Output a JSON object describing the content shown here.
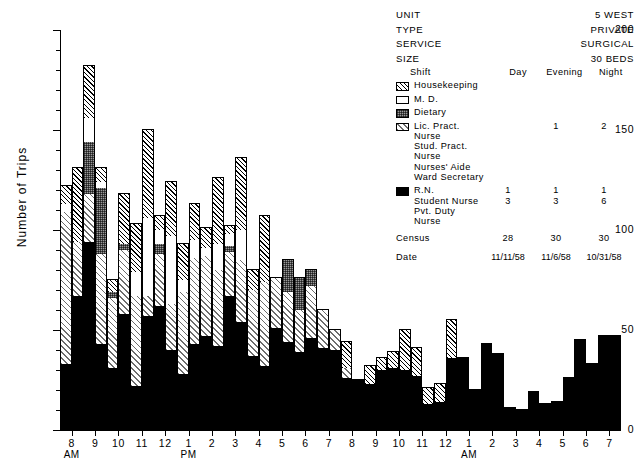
{
  "header": {
    "rows": [
      {
        "key": "UNIT",
        "value": "5 WEST"
      },
      {
        "key": "TYPE",
        "value": "PRIVATE"
      },
      {
        "key": "SERVICE",
        "value": "SURGICAL"
      },
      {
        "key": "SIZE",
        "value": "30 BEDS"
      }
    ]
  },
  "legend": {
    "shift_label": "Shift",
    "columns": [
      "Day",
      "Evening",
      "Night"
    ],
    "groups": [
      {
        "swatch": "hatch-swatch",
        "fill": "f-house",
        "names": [
          "Housekeeping"
        ],
        "counts": [
          "",
          "",
          ""
        ]
      },
      {
        "swatch": "white-swatch",
        "fill": "f-md",
        "names": [
          "M. D."
        ],
        "counts": [
          "",
          "",
          ""
        ]
      },
      {
        "swatch": "stipple-swatch",
        "fill": "f-diet",
        "names": [
          "Dietary"
        ],
        "counts": [
          "",
          "",
          ""
        ]
      },
      {
        "swatch": "light-hatch-swatch",
        "fill": "f-lpn",
        "names": [
          "Lic. Pract. Nurse",
          "Stud. Pract. Nurse",
          "Nurses' Aide",
          "Ward Secretary"
        ],
        "counts": [
          "",
          "1",
          "2",
          ""
        ]
      },
      {
        "swatch": "solid-swatch",
        "fill": "f-rn",
        "names": [
          "R.N.",
          "Student Nurse",
          "Pvt. Duty Nurse"
        ],
        "counts": [
          "1",
          "1",
          "1",
          "3",
          "3",
          "6"
        ]
      }
    ],
    "census_label": "Census",
    "census": [
      "28",
      "30",
      "30"
    ],
    "date_label": "Date",
    "dates": [
      "11/11/58",
      "11/6/58",
      "10/31/58"
    ]
  },
  "chart_data": {
    "type": "bar",
    "title": "",
    "xlabel": "",
    "ylabel": "Number of Trips",
    "ylim": [
      0,
      200
    ],
    "yticks": [
      0,
      50,
      100,
      150,
      200
    ],
    "ytick_minor_step": 10,
    "grid": false,
    "legend_position": "top-right",
    "stacked": true,
    "bars_per_hour": 2,
    "hours": [
      "8",
      "9",
      "10",
      "11",
      "12",
      "1",
      "2",
      "3",
      "4",
      "5",
      "6",
      "7",
      "8",
      "9",
      "10",
      "11",
      "12",
      "1",
      "2",
      "3",
      "4",
      "5",
      "6",
      "7"
    ],
    "hour_suffix": [
      {
        "index": 0,
        "label": "AM"
      },
      {
        "index": 5,
        "label": "PM"
      },
      {
        "index": 17,
        "label": "AM"
      }
    ],
    "series": [
      {
        "name": "R.N.",
        "fill": "f-rn"
      },
      {
        "name": "Lic. Pract. Nurse",
        "fill": "f-lpn"
      },
      {
        "name": "Dietary",
        "fill": "f-diet"
      },
      {
        "name": "M. D.",
        "fill": "f-md"
      },
      {
        "name": "Housekeeping",
        "fill": "f-house"
      }
    ],
    "bars": [
      {
        "hour": "8",
        "half": 0,
        "segments": [
          33,
          76,
          0,
          4,
          9
        ],
        "total": 122
      },
      {
        "hour": "8",
        "half": 1,
        "segments": [
          67,
          27,
          0,
          0,
          37
        ],
        "total": 131
      },
      {
        "hour": "9",
        "half": 0,
        "segments": [
          94,
          24,
          26,
          12,
          26
        ],
        "total": 182
      },
      {
        "hour": "9",
        "half": 1,
        "segments": [
          43,
          45,
          33,
          3,
          7
        ],
        "total": 131
      },
      {
        "hour": "10",
        "half": 0,
        "segments": [
          31,
          35,
          3,
          0,
          6
        ],
        "total": 75
      },
      {
        "hour": "10",
        "half": 1,
        "segments": [
          58,
          32,
          3,
          0,
          25
        ],
        "total": 118
      },
      {
        "hour": "11",
        "half": 0,
        "segments": [
          22,
          45,
          0,
          12,
          24
        ],
        "total": 103
      },
      {
        "hour": "11",
        "half": 1,
        "segments": [
          57,
          10,
          0,
          39,
          44
        ],
        "total": 150
      },
      {
        "hour": "12",
        "half": 0,
        "segments": [
          62,
          26,
          5,
          7,
          7
        ],
        "total": 107
      },
      {
        "hour": "12",
        "half": 1,
        "segments": [
          40,
          23,
          0,
          34,
          27
        ],
        "total": 124
      },
      {
        "hour": "1",
        "half": 0,
        "segments": [
          28,
          41,
          0,
          6,
          18
        ],
        "total": 93
      },
      {
        "hour": "1",
        "half": 1,
        "segments": [
          43,
          43,
          0,
          9,
          18
        ],
        "total": 113
      },
      {
        "hour": "2",
        "half": 0,
        "segments": [
          47,
          40,
          0,
          4,
          10
        ],
        "total": 101
      },
      {
        "hour": "2",
        "half": 1,
        "segments": [
          42,
          38,
          0,
          13,
          33
        ],
        "total": 126
      },
      {
        "hour": "3",
        "half": 0,
        "segments": [
          67,
          22,
          3,
          6,
          4
        ],
        "total": 102
      },
      {
        "hour": "3",
        "half": 1,
        "segments": [
          54,
          31,
          0,
          15,
          36
        ],
        "total": 136
      },
      {
        "hour": "4",
        "half": 0,
        "segments": [
          37,
          33,
          0,
          0,
          10
        ],
        "total": 80
      },
      {
        "hour": "4",
        "half": 1,
        "segments": [
          32,
          42,
          0,
          0,
          33
        ],
        "total": 107
      },
      {
        "hour": "5",
        "half": 0,
        "segments": [
          51,
          25,
          0,
          0,
          0
        ],
        "total": 76
      },
      {
        "hour": "5",
        "half": 1,
        "segments": [
          44,
          25,
          16,
          0,
          0
        ],
        "total": 85
      },
      {
        "hour": "6",
        "half": 0,
        "segments": [
          39,
          21,
          16,
          0,
          0
        ],
        "total": 76
      },
      {
        "hour": "6",
        "half": 1,
        "segments": [
          46,
          26,
          8,
          0,
          0
        ],
        "total": 80
      },
      {
        "hour": "7",
        "half": 0,
        "segments": [
          41,
          19,
          0,
          0,
          0
        ],
        "total": 60
      },
      {
        "hour": "7",
        "half": 1,
        "segments": [
          40,
          10,
          0,
          0,
          0
        ],
        "total": 50
      },
      {
        "hour": "8",
        "half": 2,
        "segments": [
          26,
          5,
          0,
          0,
          13
        ],
        "total": 44
      },
      {
        "hour": "8",
        "half": 3,
        "segments": [
          25,
          0,
          0,
          0,
          0
        ],
        "total": 25
      },
      {
        "hour": "9",
        "half": 2,
        "segments": [
          23,
          0,
          0,
          0,
          9
        ],
        "total": 32
      },
      {
        "hour": "9",
        "half": 3,
        "segments": [
          30,
          0,
          0,
          0,
          6
        ],
        "total": 36
      },
      {
        "hour": "10",
        "half": 2,
        "segments": [
          31,
          0,
          0,
          0,
          8
        ],
        "total": 39
      },
      {
        "hour": "10",
        "half": 3,
        "segments": [
          30,
          0,
          0,
          0,
          20
        ],
        "total": 50
      },
      {
        "hour": "11",
        "half": 2,
        "segments": [
          27,
          0,
          0,
          0,
          14
        ],
        "total": 41
      },
      {
        "hour": "11",
        "half": 3,
        "segments": [
          13,
          0,
          0,
          0,
          8
        ],
        "total": 21
      },
      {
        "hour": "12",
        "half": 2,
        "segments": [
          14,
          0,
          0,
          0,
          9
        ],
        "total": 23
      },
      {
        "hour": "12",
        "half": 3,
        "segments": [
          36,
          0,
          0,
          0,
          19
        ],
        "total": 55
      },
      {
        "hour": "1",
        "half": 2,
        "segments": [
          36,
          0,
          0,
          0,
          0
        ],
        "total": 36
      },
      {
        "hour": "1",
        "half": 3,
        "segments": [
          20,
          0,
          0,
          0,
          0
        ],
        "total": 20
      },
      {
        "hour": "2",
        "half": 2,
        "segments": [
          43,
          0,
          0,
          0,
          0
        ],
        "total": 43
      },
      {
        "hour": "2",
        "half": 3,
        "segments": [
          38,
          0,
          0,
          0,
          0
        ],
        "total": 38
      },
      {
        "hour": "3",
        "half": 2,
        "segments": [
          11,
          0,
          0,
          0,
          0
        ],
        "total": 11
      },
      {
        "hour": "3",
        "half": 3,
        "segments": [
          10,
          0,
          0,
          0,
          0
        ],
        "total": 10
      },
      {
        "hour": "4",
        "half": 2,
        "segments": [
          19,
          0,
          0,
          0,
          0
        ],
        "total": 19
      },
      {
        "hour": "4",
        "half": 3,
        "segments": [
          13,
          0,
          0,
          0,
          0
        ],
        "total": 13
      },
      {
        "hour": "5",
        "half": 2,
        "segments": [
          14,
          0,
          0,
          0,
          0
        ],
        "total": 14
      },
      {
        "hour": "5",
        "half": 3,
        "segments": [
          26,
          0,
          0,
          0,
          0
        ],
        "total": 26
      },
      {
        "hour": "6",
        "half": 2,
        "segments": [
          45,
          0,
          0,
          0,
          0
        ],
        "total": 45
      },
      {
        "hour": "6",
        "half": 3,
        "segments": [
          33,
          0,
          0,
          0,
          0
        ],
        "total": 33
      },
      {
        "hour": "7",
        "half": 2,
        "segments": [
          47,
          0,
          0,
          0,
          0
        ],
        "total": 47
      },
      {
        "hour": "7",
        "half": 3,
        "segments": [
          47,
          0,
          0,
          0,
          0
        ],
        "total": 47
      }
    ]
  }
}
